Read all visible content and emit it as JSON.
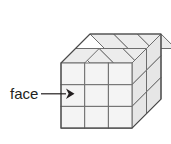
{
  "figure": {
    "title": "face",
    "alt_description": "Isometric drawing of a rectangular stack of unit cubes with one square face labelled",
    "label": {
      "text": "face",
      "x": 10,
      "y": 99,
      "font_size": 15,
      "color": "#231f20"
    },
    "arrow": {
      "name": "face-pointer-arrow",
      "from_x": 41,
      "to_x": 72,
      "y": 94,
      "color": "#231f20",
      "points_to": "front-face-cell-row2-col1"
    },
    "solid": {
      "shape": "rectangular prism of unit cubes",
      "columns": 3,
      "rows": 3,
      "depth": 2,
      "total_unit_cubes": 18,
      "origin_x": 61,
      "origin_y": 63,
      "cell_width": 23.7,
      "cell_height": 21.7,
      "depth_dx": 14.5,
      "depth_dy": -14.5
    },
    "colors": {
      "background": "#ffffff",
      "front_face_fill": "#f4f4f4",
      "top_face_fill": "#ececec",
      "side_face_fill": "#e6e6e6",
      "grid_line": "#6d6d6d",
      "outline": "#4a4a4a",
      "label": "#231f20"
    },
    "faces": {
      "front": "3 by 3 grid of squares",
      "top": "3 by 2 grid of parallelograms",
      "right": "2 by 3 grid of parallelograms"
    }
  }
}
